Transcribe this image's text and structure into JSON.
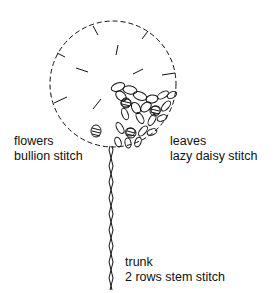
{
  "diagram": {
    "labels": {
      "flowers": {
        "title": "flowers",
        "stitch": "bullion stitch"
      },
      "leaves": {
        "title": "leaves",
        "stitch": "lazy daisy stitch"
      },
      "trunk": {
        "title": "trunk",
        "stitch": "2 rows stem stitch"
      }
    }
  }
}
